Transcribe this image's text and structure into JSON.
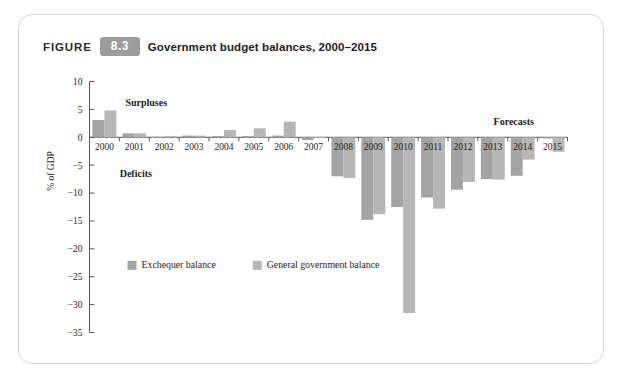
{
  "figure": {
    "label": "FIGURE",
    "number": "8.3",
    "title": "Government budget balances, 2000–2015",
    "number_badge_color": "#9c9c9c"
  },
  "annotations": {
    "surpluses": "Surpluses",
    "deficits": "Deficits",
    "forecasts": "Forecasts"
  },
  "legend": {
    "items": [
      {
        "label": "Exchequer balance",
        "color": "#a3a3a3"
      },
      {
        "label": "General government balance",
        "color": "#b6b6b6"
      }
    ]
  },
  "chart_data": {
    "type": "bar",
    "title": "Government budget balances, 2000–2015",
    "xlabel": "",
    "ylabel": "% of GDP",
    "ylim": [
      -35,
      10
    ],
    "yticks": [
      10,
      5,
      0,
      -5,
      -10,
      -15,
      -20,
      -25,
      -30,
      -35
    ],
    "ytick_labels": [
      "10",
      "5",
      "0",
      "−5",
      "−10",
      "−15",
      "−20",
      "−25",
      "−30",
      "−35"
    ],
    "grid": false,
    "legend_position": "inside-lower-left",
    "categories": [
      "2000",
      "2001",
      "2002",
      "2003",
      "2004",
      "2005",
      "2006",
      "2007",
      "2008",
      "2009",
      "2010",
      "2011",
      "2012",
      "2013",
      "2014",
      "2015"
    ],
    "series": [
      {
        "name": "Exchequer balance",
        "color": "#a3a3a3",
        "values": [
          3.1,
          0.7,
          0.1,
          0.3,
          0.2,
          0.2,
          0.3,
          -0.5,
          -7.0,
          -14.8,
          -12.5,
          -10.8,
          -9.4,
          -7.5,
          -6.9,
          -0.2
        ]
      },
      {
        "name": "General government balance",
        "color": "#b6b6b6",
        "values": [
          4.8,
          0.7,
          0.2,
          0.3,
          1.3,
          1.6,
          2.8,
          -0.1,
          -7.3,
          -13.8,
          -31.5,
          -12.8,
          -8.0,
          -7.6,
          -4.0,
          -2.6
        ]
      }
    ],
    "notes": {
      "surpluses_label_x_range": [
        "2000",
        "2002"
      ],
      "forecasts_label_x_range": [
        "2014",
        "2015"
      ],
      "forecast_divider_after": "2013"
    }
  }
}
